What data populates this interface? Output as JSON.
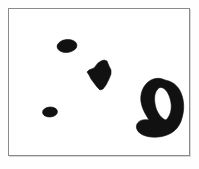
{
  "figure": {
    "background_color": "#ffffff",
    "ink_color": "#111111",
    "frame_color": "#8a8a8a",
    "frame": {
      "x": 8,
      "y": 8,
      "width": 182,
      "height": 148,
      "border_width": 1
    },
    "canvas": {
      "width": 199,
      "height": 169
    },
    "caption": "",
    "shape_count": "4"
  },
  "shapes": [
    {
      "id": "small-ellipse-upper-left",
      "label": "small ellipse",
      "kind": "ellipse",
      "cx": 58,
      "cy": 37,
      "rx": 10,
      "ry": 6.5,
      "rotation": -6
    },
    {
      "id": "small-ellipse-lower-left",
      "label": "tiny ellipse",
      "kind": "ellipse",
      "cx": 41,
      "cy": 103,
      "rx": 7.5,
      "ry": 5,
      "rotation": -4
    },
    {
      "id": "arrowhead-center",
      "label": "angular wedge",
      "kind": "polygon",
      "points": "24,13 22,9 20,4 17,3 14,4 11,6 7,11 2,13 0,15 2,18 4,22 7,26 10,30 13,33 16,32 19,28 22,22 24,17"
    },
    {
      "id": "crescent-right",
      "label": "crescent",
      "kind": "path",
      "d": "M 30,5 C 24,2 17,3 12,8 C 7,13 5,20 6,27 C 7,34 11,40 14,45 C 9,44 4,45 2,49 C 0,53 3,58 8,60 C 15,63 24,63 32,60 C 40,57 45,51 47,43 C 50,33 49,22 44,14 C 40,8 35,6 30,5 Z M 28,13 C 32,15 35,21 36,28 C 37,35 35,41 31,45 C 27,44 23,39 21,33 C 19,26 19,19 22,15 C 24,12 26,12 28,13 Z"
    }
  ]
}
